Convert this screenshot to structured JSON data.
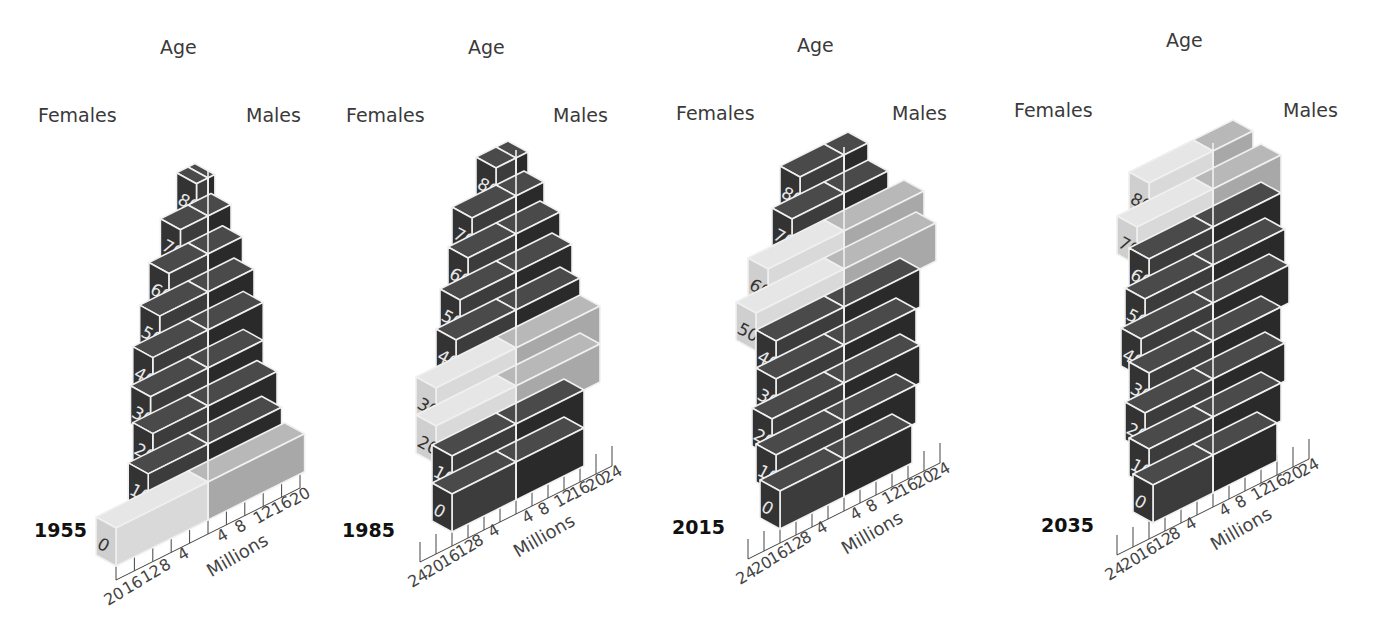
{
  "labels": {
    "age": "Age",
    "females": "Females",
    "males": "Males",
    "millions": "Millions"
  },
  "colors": {
    "dark_front": "#3c3c3c",
    "dark_side": "#2a2a2a",
    "dark_top": "#4a4a4a",
    "light_front": "#d9d9d9",
    "light_side": "#c4c4c4",
    "light_top": "#e6e6e6",
    "male_light_front": "#a8a8a8",
    "male_light_top": "#b8b8b8",
    "edge": "#f0f0f0"
  },
  "chart_data": {
    "type": "bar",
    "subtype": "3d-population-pyramid",
    "title": "",
    "xlabel": "Millions",
    "ylabel": "Age",
    "note": "Light-shaded boxes highlight a cohort tracked across years (baby-boom generation).",
    "categories": [
      "0",
      "10",
      "20",
      "30",
      "40",
      "50",
      "60",
      "70",
      "80+"
    ],
    "panels": [
      {
        "year": "1955",
        "x_ticks_left": [
          "20",
          "16",
          "12",
          "8",
          "4"
        ],
        "x_ticks_right": [
          "4",
          "8",
          "12",
          "16",
          "20"
        ],
        "xlim": [
          20,
          20
        ],
        "series": [
          {
            "name": "Females",
            "values": [
              20,
              13,
              12,
              12.5,
              12,
              10.5,
              8.5,
              6,
              2.5
            ]
          },
          {
            "name": "Males",
            "values": [
              21,
              16,
              15,
              12,
              12,
              10,
              7.5,
              5,
              1.5
            ]
          }
        ],
        "highlight": [
          "0"
        ]
      },
      {
        "year": "1985",
        "x_ticks_left": [
          "24",
          "20",
          "16",
          "12",
          "8",
          "4"
        ],
        "x_ticks_right": [
          "4",
          "8",
          "12",
          "16",
          "20",
          "24"
        ],
        "xlim": [
          24,
          24
        ],
        "series": [
          {
            "name": "Females",
            "values": [
              16,
              16,
              20,
              20,
              15,
              14,
              12,
              11,
              5
            ]
          },
          {
            "name": "Males",
            "values": [
              17,
              17,
              21,
              21,
              16,
              14,
              11,
              7,
              3
            ]
          }
        ],
        "highlight": [
          "20",
          "30"
        ]
      },
      {
        "year": "2015",
        "x_ticks_left": [
          "24",
          "20",
          "16",
          "12",
          "8",
          "4"
        ],
        "x_ticks_right": [
          "4",
          "8",
          "12",
          "16",
          "20",
          "24"
        ],
        "xlim": [
          24,
          24
        ],
        "series": [
          {
            "name": "Females",
            "values": [
              16,
              17,
              18,
              17,
              17,
              22,
              19,
              13,
              11
            ]
          },
          {
            "name": "Males",
            "values": [
              17,
              18,
              19,
              18,
              19,
              23,
              20,
              11,
              6
            ]
          }
        ],
        "highlight": [
          "50",
          "60"
        ]
      },
      {
        "year": "2035",
        "x_ticks_left": [
          "24",
          "20",
          "16",
          "12",
          "8",
          "4"
        ],
        "x_ticks_right": [
          "4",
          "8",
          "12",
          "16",
          "20",
          "24"
        ],
        "xlim": [
          24,
          24
        ],
        "series": [
          {
            "name": "Females",
            "values": [
              15,
              16,
              17,
              16,
              18,
              17,
              16,
              19,
              16
            ]
          },
          {
            "name": "Males",
            "values": [
              16,
              17,
              18,
              17,
              19,
              18,
              17,
              17,
              10
            ]
          }
        ],
        "highlight": [
          "70",
          "80+"
        ]
      }
    ]
  },
  "panels_layout": [
    {
      "left": 0,
      "year": "1955",
      "cx": 208,
      "base_y": 520,
      "scale": 4.6,
      "max": 20,
      "age_x": 160,
      "age_y": 40,
      "fem_x": 38,
      "fem_y": 108,
      "male_x": 246,
      "male_y": 108,
      "year_x": 34,
      "year_y": 523
    },
    {
      "left": 330,
      "year": "1985",
      "cx": 186,
      "base_y": 500,
      "scale": 4.0,
      "max": 24,
      "age_x": 138,
      "age_y": 40,
      "fem_x": 16,
      "fem_y": 108,
      "male_x": 223,
      "male_y": 108,
      "year_x": 12,
      "year_y": 523
    },
    {
      "left": 660,
      "year": "2015",
      "cx": 184,
      "base_y": 497,
      "scale": 4.0,
      "max": 24,
      "age_x": 137,
      "age_y": 38,
      "fem_x": 16,
      "fem_y": 106,
      "male_x": 232,
      "male_y": 106,
      "year_x": 12,
      "year_y": 520
    },
    {
      "left": 1000,
      "year": "2035",
      "cx": 213,
      "base_y": 493,
      "scale": 4.0,
      "max": 24,
      "age_x": 166,
      "age_y": 33,
      "fem_x": 14,
      "fem_y": 103,
      "male_x": 283,
      "male_y": 103,
      "year_x": 41,
      "year_y": 518
    }
  ]
}
